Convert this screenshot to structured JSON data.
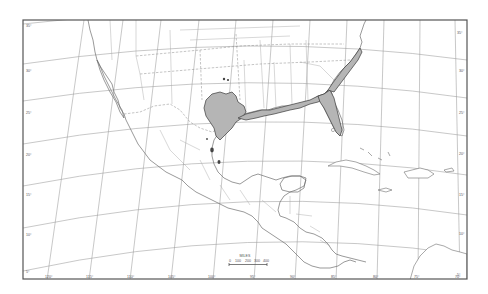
{
  "map": {
    "title": "",
    "range_fill_color": "#b5b5b5",
    "range_stroke_color": "#3a3a3a",
    "background_color": "#ffffff",
    "latitude_labels_left": [
      "35°",
      "30°",
      "25°",
      "20°",
      "15°",
      "10°",
      "5°"
    ],
    "latitude_labels_right": [
      "35°",
      "30°",
      "25°",
      "20°",
      "15°",
      "10°",
      "5°"
    ],
    "longitude_labels_bottom": [
      "120°",
      "115°",
      "110°",
      "105°",
      "100°",
      "95°",
      "90°",
      "85°",
      "80°",
      "75°",
      "70°"
    ],
    "scale_bar": {
      "unit_label": "MILES",
      "ticks": [
        "0",
        "100",
        "200",
        "300",
        "400"
      ]
    },
    "regions_depicted": [
      "United States (southern)",
      "Mexico",
      "Central America",
      "Caribbean"
    ],
    "shaded_range": [
      "Texas (central/east)",
      "Gulf Coast",
      "Florida peninsula",
      "Atlantic coast to North Carolina"
    ],
    "outlying_records": 5
  }
}
